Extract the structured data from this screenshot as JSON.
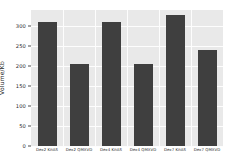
{
  "chart_data": {
    "type": "bar",
    "title": "",
    "xlabel": "",
    "ylabel": "Volume/Kb",
    "ylim": [
      0,
      340
    ],
    "yticks": [
      0,
      50,
      100,
      150,
      200,
      250,
      300
    ],
    "ytick_labels": [
      "0",
      "50",
      "100",
      "150",
      "200",
      "250",
      "300"
    ],
    "grid": true,
    "legend": "none",
    "bar_color": "#3f3f3f",
    "panel_color": "#e9e9e9",
    "gridline_color": "#fdfdfd",
    "categories": [
      "Dex2 KitAS",
      "Dex2 QMXVD",
      "Dex4 KitAS",
      "Dex4 QMXVD",
      "Dex7 KitAS",
      "Dex7 QMXVD"
    ],
    "values": [
      310,
      205,
      311,
      206,
      328,
      240
    ]
  }
}
